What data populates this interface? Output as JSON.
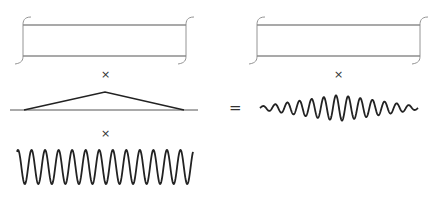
{
  "figure": {
    "operators": {
      "times_1": "×",
      "times_2": "×",
      "times_3": "×",
      "equals": "="
    },
    "colors": {
      "stroke": "#222222",
      "window_stroke": "#555555",
      "bracket_stroke": "#888888"
    },
    "left_column": {
      "rect_window": {
        "x": 23,
        "y": 25,
        "width": 163,
        "height": 31
      },
      "triangle_envelope": {
        "baseline_y": 110,
        "x_start": 10,
        "x_end": 198,
        "peak_x": 105,
        "peak_y": 92,
        "tri_left": 24,
        "tri_right": 184
      },
      "sinusoid": {
        "x_start": 17,
        "x_end": 193,
        "center_y": 167,
        "amplitude": 17,
        "cycles": 13
      }
    },
    "right_column": {
      "rect_window": {
        "x": 257,
        "y": 25,
        "width": 163,
        "height": 31
      },
      "wave_packet": {
        "x_start": 260,
        "x_end": 418,
        "center_y": 108,
        "amplitude": 13,
        "cycles": 13
      }
    }
  }
}
